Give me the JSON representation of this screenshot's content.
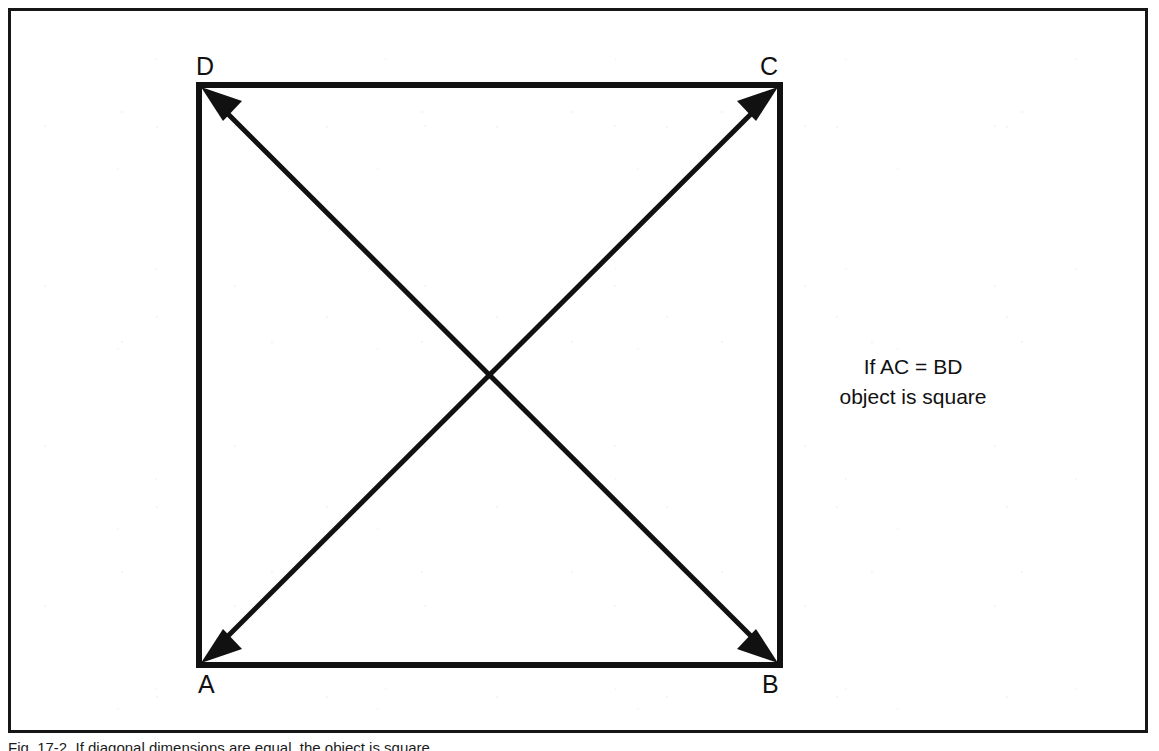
{
  "figure": {
    "frame_color": "#161616",
    "background_color": "#ffffff",
    "stroke_color": "#111111"
  },
  "diagram": {
    "shape_name": "square",
    "vertices": {
      "top_left": "D",
      "top_right": "C",
      "bottom_left": "A",
      "bottom_right": "B"
    },
    "diagonals": [
      {
        "name": "AC",
        "from": "A",
        "to": "C",
        "double_headed": true
      },
      {
        "name": "BD",
        "from": "B",
        "to": "D",
        "double_headed": true
      }
    ]
  },
  "annotation": {
    "line1": "If AC  =  BD",
    "line2": "object is square"
  },
  "caption": {
    "text": "Fig. 17-2. If diagonal dimensions are equal, the object is square."
  }
}
